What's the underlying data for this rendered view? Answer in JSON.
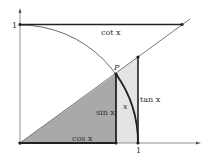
{
  "diagram": {
    "labels": {
      "y_one": "1",
      "x_one": "1",
      "point": "P",
      "cot": "cot x",
      "sin": "sin x",
      "arc": "x",
      "tan": "tan x",
      "cos": "cos x"
    },
    "colors": {
      "stroke": "#222222",
      "dark_fill": "#a9a9a9",
      "light_fill": "#e4e4e4",
      "axis": "#777777"
    }
  }
}
